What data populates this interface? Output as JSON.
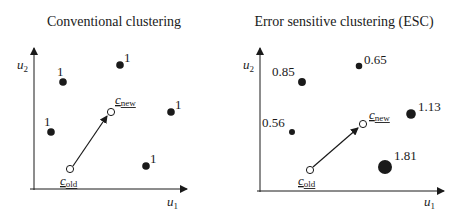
{
  "panels": [
    {
      "title": "Conventional clustering",
      "y_axis_label": "u",
      "y_axis_sub": "2",
      "x_axis_label": "u",
      "x_axis_sub": "1",
      "points": [
        {
          "label": "1",
          "weight": 1
        },
        {
          "label": "1",
          "weight": 1
        },
        {
          "label": "1",
          "weight": 1
        },
        {
          "label": "1",
          "weight": 1
        },
        {
          "label": "1",
          "weight": 1
        }
      ],
      "centroid_old": {
        "label": "c",
        "sub": "old"
      },
      "centroid_new": {
        "label": "c",
        "sub": "new"
      }
    },
    {
      "title": "Error sensitive clustering (ESC)",
      "y_axis_label": "u",
      "y_axis_sub": "2",
      "x_axis_label": "u",
      "x_axis_sub": "1",
      "points": [
        {
          "label": "0.85",
          "weight": 0.85
        },
        {
          "label": "0.65",
          "weight": 0.65
        },
        {
          "label": "0.56",
          "weight": 0.56
        },
        {
          "label": "1.13",
          "weight": 1.13
        },
        {
          "label": "1.81",
          "weight": 1.81
        }
      ],
      "centroid_old": {
        "label": "c",
        "sub": "old"
      },
      "centroid_new": {
        "label": "c",
        "sub": "new"
      }
    }
  ],
  "colors": {
    "ink": "#1a1a1a",
    "background": "#ffffff"
  }
}
